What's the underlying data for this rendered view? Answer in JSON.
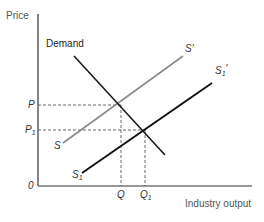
{
  "diagram": {
    "axes": {
      "y_label": "Price",
      "x_label": "Industry output",
      "origin_label": "0"
    },
    "curves": {
      "demand": {
        "label": "Demand",
        "color": "#1a1a1a"
      },
      "s": {
        "label": "S",
        "color": "#8a8a8a"
      },
      "s_prime": {
        "label": "S",
        "prime": "′",
        "color": "#8a8a8a"
      },
      "s1": {
        "label": "S",
        "sub": "1",
        "color": "#111111"
      },
      "s1_prime": {
        "label": "S",
        "sub": "1",
        "prime": "′",
        "color": "#111111"
      }
    },
    "price_levels": {
      "p": {
        "label": "P"
      },
      "p1": {
        "label": "P",
        "sub": "1"
      }
    },
    "quantity_levels": {
      "q": {
        "label": "Q"
      },
      "q1": {
        "label": "Q",
        "sub": "1"
      }
    },
    "colors": {
      "axis": "#333333",
      "dashed_guides": "#555555",
      "gray_supply": "#8a8a8a",
      "black_supply": "#111111",
      "demand": "#1a1a1a"
    }
  }
}
